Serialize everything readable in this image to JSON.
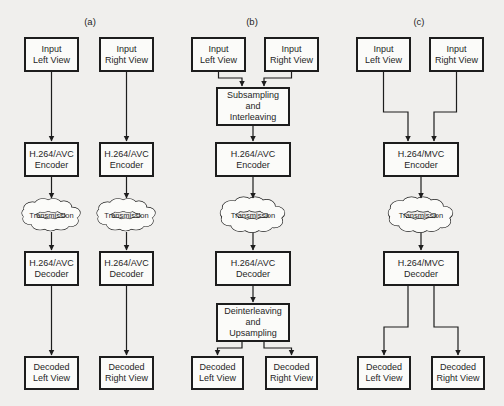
{
  "figure": {
    "type": "block-diagram"
  },
  "colors": {
    "background": "#f0efed",
    "box_fill": "#fbfbf9",
    "line": "#1d1d1d",
    "text": "#262626"
  },
  "panels": [
    {
      "label": "(a)",
      "nodes": {
        "input_left": "Input\nLeft View",
        "input_right": "Input\nRight View",
        "encoder_left": "H.264/AVC\nEncoder",
        "encoder_right": "H.264/AVC\nEncoder",
        "transmission_left": "Transmission",
        "transmission_right": "Transmission",
        "decoder_left": "H.264/AVC\nDecoder",
        "decoder_right": "H.264/AVC\nDecoder",
        "decoded_left": "Decoded\nLeft View",
        "decoded_right": "Decoded\nRight View"
      }
    },
    {
      "label": "(b)",
      "nodes": {
        "input_left": "Input\nLeft View",
        "input_right": "Input\nRight View",
        "subsampling": "Subsampling\nand\nInterleaving",
        "encoder": "H.264/AVC\nEncoder",
        "transmission": "Transmission",
        "decoder": "H.264/AVC\nDecoder",
        "deinterleaving": "Deinterleaving\nand\nUpsampling",
        "decoded_left": "Decoded\nLeft View",
        "decoded_right": "Decoded\nRight View"
      }
    },
    {
      "label": "(c)",
      "nodes": {
        "input_left": "Input\nLeft View",
        "input_right": "Input\nRight View",
        "encoder": "H.264/MVC\nEncoder",
        "transmission": "Transmission",
        "decoder": "H.264/MVC\nDecoder",
        "decoded_left": "Decoded\nLeft View",
        "decoded_right": "Decoded\nRight View"
      }
    }
  ]
}
